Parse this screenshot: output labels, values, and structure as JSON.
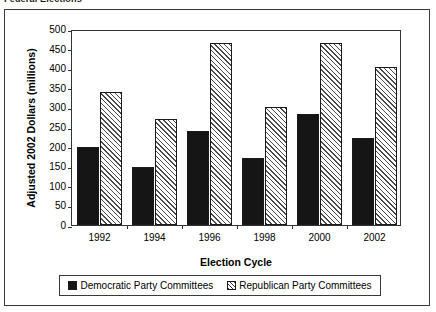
{
  "caption": "Federal Elections",
  "chart_data": {
    "type": "bar",
    "title": "",
    "xlabel": "Election Cycle",
    "ylabel": "Adjusted 2002 Dollars (millions)",
    "categories": [
      "1992",
      "1994",
      "1996",
      "1998",
      "2000",
      "2002"
    ],
    "series": [
      {
        "name": "Democratic Party Committees",
        "values": [
          200,
          148,
          240,
          170,
          282,
          221
        ],
        "color": "#151515",
        "pattern": "solid"
      },
      {
        "name": "Republican Party Committees",
        "values": [
          340,
          270,
          465,
          300,
          465,
          403
        ],
        "color": "#ffffff",
        "pattern": "diagonal-hatch"
      }
    ],
    "ylim": [
      0,
      500
    ],
    "yticks": [
      0,
      50,
      100,
      150,
      200,
      250,
      300,
      350,
      400,
      450,
      500
    ],
    "ytick_labels": [
      "0",
      "50",
      "100",
      "150",
      "200",
      "250",
      "300",
      "350",
      "400",
      "450",
      "500"
    ],
    "grid": false,
    "legend_position": "bottom"
  }
}
